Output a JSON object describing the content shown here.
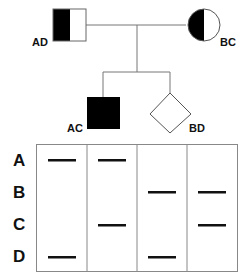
{
  "pedigree": {
    "individuals": [
      {
        "id": "AD",
        "label": "AD",
        "shape": "square",
        "fill": "half-left-filled",
        "generation": 1
      },
      {
        "id": "BC",
        "label": "BC",
        "shape": "circle",
        "fill": "half-left-filled",
        "generation": 1
      },
      {
        "id": "AC",
        "label": "AC",
        "shape": "square",
        "fill": "filled",
        "generation": 2
      },
      {
        "id": "BD",
        "label": "BD",
        "shape": "diamond",
        "fill": "empty",
        "generation": 2
      }
    ]
  },
  "gel": {
    "row_labels": [
      "A",
      "B",
      "C",
      "D"
    ],
    "lanes": [
      {
        "individual": "AD",
        "bands": [
          "A",
          "D"
        ]
      },
      {
        "individual": "AC",
        "bands": [
          "A",
          "C"
        ]
      },
      {
        "individual": "BD",
        "bands": [
          "B",
          "D"
        ]
      },
      {
        "individual": "BC",
        "bands": [
          "B",
          "C"
        ]
      }
    ]
  },
  "colors": {
    "ink": "#000000",
    "line": "#888888",
    "background": "#ffffff"
  }
}
